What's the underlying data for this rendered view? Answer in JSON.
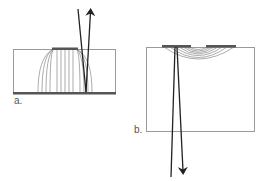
{
  "panels": [
    {
      "id": "a",
      "label": "a.",
      "description": "Parallel-plate electrode configuration: top electrode on substrate, bottom ground plane, field lines vertical with fringing arcs at edges; incident and reflected beam on top side"
    },
    {
      "id": "b",
      "label": "b.",
      "description": "Coplanar electrode configuration: two top electrodes with fringing arc field lines between them; beam transmitted downward through substrate"
    }
  ],
  "colors": {
    "outline": "#9a9a9a",
    "electrode": "#555555",
    "field_line": "#888888",
    "beam": "#222222",
    "label": "#555555"
  }
}
